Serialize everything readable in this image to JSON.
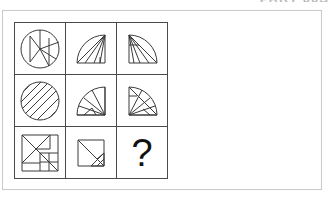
{
  "page": {
    "background_color": "#ffffff",
    "clipped_header_text": "PART 00S",
    "frame_color": "#c9c9c9",
    "grid_line_color": "#4a4a4a",
    "figure_stroke_color": "#3a3a3a"
  },
  "puzzle": {
    "type": "matrix-reasoning",
    "rows": 3,
    "columns": 3,
    "missing_cell": "r3c3",
    "missing_marker": "?",
    "cells": [
      {
        "id": "r1c1",
        "row": 1,
        "column": 1,
        "shape": "circle",
        "description": "full circle divided by internal straight lines into wedge and strip segments",
        "segments": 6,
        "fill": "none"
      },
      {
        "id": "r1c2",
        "row": 1,
        "column": 2,
        "shape": "quarter-circle",
        "description": "quarter disc in a right-angle corner, subdivided by radiating lines",
        "segments": 5,
        "fill": "none"
      },
      {
        "id": "r1c3",
        "row": 1,
        "column": 3,
        "shape": "quarter-circle",
        "description": "quarter disc rotated, subdivided by radiating lines",
        "segments": 5,
        "fill": "none"
      },
      {
        "id": "r2c1",
        "row": 2,
        "column": 1,
        "shape": "circle",
        "description": "full circle filled with parallel diagonal hatch lines",
        "segments": 8,
        "fill": "diagonal-hatch"
      },
      {
        "id": "r2c2",
        "row": 2,
        "column": 2,
        "shape": "quarter-circle",
        "description": "quarter disc with fan of radiating lines from the corner",
        "segments": 5,
        "fill": "none"
      },
      {
        "id": "r2c3",
        "row": 2,
        "column": 3,
        "shape": "quarter-circle",
        "description": "quarter disc rotated with fan of radiating lines",
        "segments": 5,
        "fill": "none"
      },
      {
        "id": "r3c1",
        "row": 3,
        "column": 1,
        "shape": "square",
        "description": "square tangram dissection with diagonals and nested rectangles",
        "segments": 7,
        "fill": "none"
      },
      {
        "id": "r3c2",
        "row": 3,
        "column": 2,
        "shape": "square",
        "description": "square with main diagonal and smaller triangle subdivisions",
        "segments": 5,
        "fill": "none"
      },
      {
        "id": "r3c3",
        "row": 3,
        "column": 3,
        "shape": "question-mark",
        "description": "unknown answer cell",
        "segments": 0,
        "fill": "none"
      }
    ]
  }
}
